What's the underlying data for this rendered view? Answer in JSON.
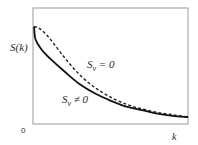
{
  "chart_data": {
    "type": "line",
    "title": "",
    "xlabel": "k",
    "ylabel": "S(k)",
    "origin_label": "0",
    "grid": false,
    "legend": "inline annotations",
    "xlim": [
      0,
      1
    ],
    "ylim": [
      0,
      1
    ],
    "series": [
      {
        "name": "S_v = 0",
        "label_main": "S",
        "label_sub": "v",
        "label_rest": " = 0",
        "style": "dashed",
        "color": "#222222",
        "x": [
          0.0,
          0.04,
          0.1,
          0.2,
          0.3,
          0.4,
          0.5,
          0.6,
          0.7,
          0.8,
          0.9,
          1.0
        ],
        "y": [
          0.84,
          0.82,
          0.74,
          0.57,
          0.42,
          0.31,
          0.23,
          0.17,
          0.13,
          0.1,
          0.08,
          0.06
        ]
      },
      {
        "name": "S_v ≠ 0",
        "label_main": "S",
        "label_sub": "v",
        "label_rest": " ≠ 0",
        "style": "solid",
        "color": "#111111",
        "x": [
          0.0,
          0.01,
          0.05,
          0.1,
          0.2,
          0.3,
          0.4,
          0.5,
          0.6,
          0.7,
          0.8,
          0.9,
          1.0
        ],
        "y": [
          0.84,
          0.73,
          0.64,
          0.57,
          0.45,
          0.34,
          0.26,
          0.2,
          0.15,
          0.12,
          0.09,
          0.07,
          0.06
        ]
      }
    ]
  }
}
